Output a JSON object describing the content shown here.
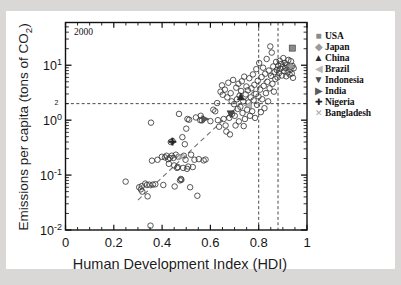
{
  "figure": {
    "background_color": "#d9d8d6",
    "paper_color": "#ffffff",
    "annotation_year": "2000"
  },
  "axes": {
    "x_title": "Human Development Index (HDI)",
    "y_title_pre": "Emissions per capita (tons of CO",
    "y_title_sub": "2",
    "y_title_post": ")",
    "x_ticks": [
      "0",
      "0.2",
      "0.4",
      "0.6",
      "0.8",
      "1"
    ],
    "y_tick_bases": [
      "10",
      "10",
      "10",
      "10"
    ],
    "y_tick_exponents": [
      "1",
      "0",
      "-1",
      "-2"
    ],
    "y_extra_label": "2"
  },
  "legend": {
    "items": [
      {
        "label": "USA",
        "marker": "filled-square",
        "marker_glyph": "■",
        "color": "#8a8a8a"
      },
      {
        "label": "Japan",
        "marker": "filled-diamond",
        "marker_glyph": "◆",
        "color": "#9a9a9a"
      },
      {
        "label": "China",
        "marker": "filled-triangle-up",
        "marker_glyph": "▲",
        "color": "#2a2a2a"
      },
      {
        "label": "Brazil",
        "marker": "filled-triangle-left",
        "marker_glyph": "◀",
        "color": "#b8b8b8"
      },
      {
        "label": "Indonesia",
        "marker": "filled-triangle-down",
        "marker_glyph": "▼",
        "color": "#4a4a4a"
      },
      {
        "label": "India",
        "marker": "filled-triangle-right",
        "marker_glyph": "▶",
        "color": "#5a5a5a"
      },
      {
        "label": "Nigeria",
        "marker": "plus-cross",
        "marker_glyph": "✚",
        "color": "#222222"
      },
      {
        "label": "Bangladesh",
        "marker": "cross-x",
        "marker_glyph": "✕",
        "color": "#a6a6a6"
      }
    ]
  },
  "chart_data": {
    "type": "scatter",
    "title": "",
    "subtitle": "",
    "annotation": "2000",
    "xlabel": "Human Development Index (HDI)",
    "ylabel": "Emissions per capita (tons of CO2)",
    "xlim": [
      0,
      1
    ],
    "ylim": [
      0.01,
      60
    ],
    "yscale": "log",
    "xscale": "linear",
    "grid": false,
    "legend_position": "right-outside",
    "reference_lines": [
      {
        "orientation": "horizontal",
        "value": 2.0,
        "style": "dashed",
        "label": "2"
      },
      {
        "orientation": "vertical",
        "value": 0.8,
        "style": "dashed",
        "label": ""
      },
      {
        "orientation": "vertical",
        "value": 0.88,
        "style": "dashed",
        "label": ""
      }
    ],
    "trend_line": {
      "style": "dashed",
      "x": [
        0.3,
        0.93
      ],
      "y": [
        0.035,
        14.0
      ]
    },
    "series": [
      {
        "name": "Countries",
        "marker": "open-circle",
        "points": [
          [
            0.249,
            0.076
          ],
          [
            0.305,
            0.06
          ],
          [
            0.312,
            0.055
          ],
          [
            0.316,
            0.063
          ],
          [
            0.318,
            0.05
          ],
          [
            0.33,
            0.07
          ],
          [
            0.337,
            0.066
          ],
          [
            0.34,
            0.041
          ],
          [
            0.347,
            0.067
          ],
          [
            0.352,
            0.012
          ],
          [
            0.354,
            0.9
          ],
          [
            0.358,
            0.183
          ],
          [
            0.362,
            0.067
          ],
          [
            0.372,
            0.068
          ],
          [
            0.381,
            0.19
          ],
          [
            0.399,
            0.215
          ],
          [
            0.405,
            0.066
          ],
          [
            0.412,
            0.21
          ],
          [
            0.418,
            0.225
          ],
          [
            0.425,
            0.195
          ],
          [
            0.428,
            0.16
          ],
          [
            0.432,
            0.205
          ],
          [
            0.436,
            0.4
          ],
          [
            0.44,
            0.225
          ],
          [
            0.443,
            0.415
          ],
          [
            0.447,
            0.205
          ],
          [
            0.45,
            0.15
          ],
          [
            0.452,
            0.062
          ],
          [
            0.457,
            0.235
          ],
          [
            0.462,
            0.135
          ],
          [
            0.465,
            0.14
          ],
          [
            0.468,
            0.215
          ],
          [
            0.47,
            1.3
          ],
          [
            0.474,
            0.08
          ],
          [
            0.478,
            0.085
          ],
          [
            0.48,
            0.082
          ],
          [
            0.484,
            0.49
          ],
          [
            0.487,
            0.135
          ],
          [
            0.49,
            0.225
          ],
          [
            0.494,
            0.365
          ],
          [
            0.497,
            0.19
          ],
          [
            0.5,
            0.7
          ],
          [
            0.503,
            0.13
          ],
          [
            0.505,
            1.05
          ],
          [
            0.508,
            0.143
          ],
          [
            0.512,
            1.02
          ],
          [
            0.516,
            0.06
          ],
          [
            0.52,
            0.235
          ],
          [
            0.527,
            0.14
          ],
          [
            0.534,
            0.19
          ],
          [
            0.54,
            1.12
          ],
          [
            0.546,
            0.042
          ],
          [
            0.552,
            0.195
          ],
          [
            0.558,
            1.0
          ],
          [
            0.56,
            1.2
          ],
          [
            0.565,
            0.99
          ],
          [
            0.572,
            0.185
          ],
          [
            0.58,
            0.192
          ],
          [
            0.6,
            0.96
          ],
          [
            0.612,
            1.55
          ],
          [
            0.62,
            1.45
          ],
          [
            0.628,
            2.05
          ],
          [
            0.631,
            1.0
          ],
          [
            0.636,
            0.76
          ],
          [
            0.642,
            3.3
          ],
          [
            0.648,
            4.3
          ],
          [
            0.651,
            2.9
          ],
          [
            0.655,
            1.05
          ],
          [
            0.66,
            3.6
          ],
          [
            0.663,
            0.8
          ],
          [
            0.666,
            0.62
          ],
          [
            0.67,
            2.6
          ],
          [
            0.674,
            4.8
          ],
          [
            0.678,
            1.1
          ],
          [
            0.681,
            0.55
          ],
          [
            0.684,
            3.1
          ],
          [
            0.688,
            2.2
          ],
          [
            0.69,
            1.3
          ],
          [
            0.694,
            5.4
          ],
          [
            0.698,
            1.95
          ],
          [
            0.701,
            1.2
          ],
          [
            0.704,
            0.8
          ],
          [
            0.707,
            3.9
          ],
          [
            0.71,
            2.4
          ],
          [
            0.713,
            1.6
          ],
          [
            0.716,
            4.6
          ],
          [
            0.718,
            0.95
          ],
          [
            0.721,
            2.8
          ],
          [
            0.724,
            1.75
          ],
          [
            0.727,
            3.4
          ],
          [
            0.73,
            5.1
          ],
          [
            0.733,
            1.35
          ],
          [
            0.736,
            2.2
          ],
          [
            0.738,
            0.78
          ],
          [
            0.74,
            6.2
          ],
          [
            0.743,
            1.05
          ],
          [
            0.746,
            2.95
          ],
          [
            0.749,
            4.1
          ],
          [
            0.752,
            1.55
          ],
          [
            0.755,
            3.5
          ],
          [
            0.758,
            2.1
          ],
          [
            0.761,
            5.8
          ],
          [
            0.764,
            1.2
          ],
          [
            0.767,
            2.6
          ],
          [
            0.77,
            3.8
          ],
          [
            0.773,
            1.45
          ],
          [
            0.776,
            6.8
          ],
          [
            0.779,
            2.3
          ],
          [
            0.782,
            4.4
          ],
          [
            0.785,
            1.1
          ],
          [
            0.788,
            3.0
          ],
          [
            0.79,
            8.5
          ],
          [
            0.793,
            1.9
          ],
          [
            0.796,
            5.2
          ],
          [
            0.799,
            2.7
          ],
          [
            0.802,
            11.0
          ],
          [
            0.806,
            3.6
          ],
          [
            0.809,
            1.4
          ],
          [
            0.812,
            6.1
          ],
          [
            0.815,
            2.4
          ],
          [
            0.818,
            9.0
          ],
          [
            0.821,
            4.2
          ],
          [
            0.824,
            1.65
          ],
          [
            0.827,
            7.0
          ],
          [
            0.83,
            3.1
          ],
          [
            0.833,
            13.0
          ],
          [
            0.836,
            5.0
          ],
          [
            0.839,
            2.2
          ],
          [
            0.842,
            8.0
          ],
          [
            0.845,
            3.8
          ],
          [
            0.848,
            22.0
          ],
          [
            0.851,
            6.4
          ],
          [
            0.854,
            17.0
          ],
          [
            0.857,
            4.6
          ],
          [
            0.86,
            9.5
          ],
          [
            0.863,
            3.3
          ],
          [
            0.866,
            7.5
          ],
          [
            0.869,
            5.6
          ],
          [
            0.872,
            11.5
          ],
          [
            0.875,
            8.2
          ],
          [
            0.878,
            6.0
          ],
          [
            0.881,
            9.8
          ],
          [
            0.884,
            7.2
          ],
          [
            0.887,
            12.0
          ],
          [
            0.89,
            8.6
          ],
          [
            0.893,
            10.5
          ],
          [
            0.896,
            6.5
          ],
          [
            0.899,
            9.2
          ],
          [
            0.902,
            13.5
          ],
          [
            0.905,
            7.8
          ],
          [
            0.908,
            11.0
          ],
          [
            0.911,
            8.9
          ],
          [
            0.914,
            6.3
          ],
          [
            0.917,
            10.0
          ],
          [
            0.92,
            7.4
          ],
          [
            0.923,
            12.5
          ],
          [
            0.925,
            9.4
          ],
          [
            0.928,
            6.8
          ],
          [
            0.931,
            8.3
          ],
          [
            0.934,
            11.8
          ],
          [
            0.937,
            7.1
          ],
          [
            0.94,
            9.7
          ],
          [
            0.942,
            5.9
          ],
          [
            0.945,
            8.8
          ]
        ]
      },
      {
        "name": "USA",
        "marker": "filled-square",
        "points": [
          [
            0.939,
            20.5
          ]
        ]
      },
      {
        "name": "Japan",
        "marker": "filled-diamond",
        "points": [
          [
            0.933,
            9.6
          ]
        ]
      },
      {
        "name": "China",
        "marker": "filled-triangle-up",
        "points": [
          [
            0.726,
            2.65
          ]
        ]
      },
      {
        "name": "Brazil",
        "marker": "filled-triangle-left",
        "points": [
          [
            0.757,
            1.85
          ]
        ]
      },
      {
        "name": "Indonesia",
        "marker": "filled-triangle-down",
        "points": [
          [
            0.684,
            1.3
          ]
        ]
      },
      {
        "name": "India",
        "marker": "filled-triangle-right",
        "points": [
          [
            0.577,
            1.05
          ]
        ]
      },
      {
        "name": "Nigeria",
        "marker": "plus-cross",
        "points": [
          [
            0.443,
            0.405
          ]
        ]
      },
      {
        "name": "Bangladesh",
        "marker": "cross-x",
        "points": [
          [
            0.478,
            0.215
          ]
        ]
      }
    ]
  }
}
